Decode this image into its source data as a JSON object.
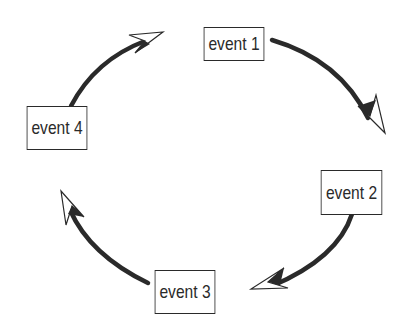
{
  "diagram": {
    "type": "cycle",
    "nodes": [
      {
        "id": "event1",
        "label": "event 1"
      },
      {
        "id": "event2",
        "label": "event 2"
      },
      {
        "id": "event3",
        "label": "event 3"
      },
      {
        "id": "event4",
        "label": "event 4"
      }
    ],
    "edges": [
      {
        "from": "event1",
        "to": "event2",
        "direction": "clockwise"
      },
      {
        "from": "event2",
        "to": "event3",
        "direction": "clockwise"
      },
      {
        "from": "event3",
        "to": "event4",
        "direction": "clockwise"
      },
      {
        "from": "event4",
        "to": "event1",
        "direction": "clockwise"
      }
    ],
    "colors": {
      "stroke": "#2a2a2a",
      "background": "#ffffff"
    }
  }
}
